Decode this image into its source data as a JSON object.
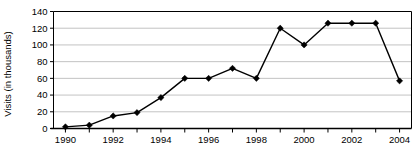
{
  "chart_data": {
    "type": "line",
    "title": "",
    "xlabel": "",
    "ylabel": "Visits (in thousands)",
    "x": [
      1990,
      1991,
      1992,
      1993,
      1994,
      1995,
      1996,
      1997,
      1998,
      1999,
      2000,
      2001,
      2002,
      2003,
      2004
    ],
    "values": [
      2,
      4,
      15,
      19,
      37,
      60,
      60,
      72,
      60,
      120,
      100,
      126,
      126,
      126,
      57
    ],
    "xlim": [
      1989.5,
      2004.5
    ],
    "ylim": [
      0,
      140
    ],
    "ytick_labels": [
      "0",
      "20",
      "40",
      "60",
      "80",
      "100",
      "120",
      "140"
    ],
    "ytick_values": [
      0,
      20,
      40,
      60,
      80,
      100,
      120,
      140
    ],
    "xtick_labels": [
      "1990",
      "1992",
      "1994",
      "1996",
      "1998",
      "2000",
      "2002",
      "2004"
    ],
    "xtick_values": [
      1990,
      1992,
      1994,
      1996,
      1998,
      2000,
      2002,
      2004
    ],
    "xminor_values": [
      1991,
      1993,
      1995,
      1997,
      1999,
      2001,
      2003
    ],
    "grid": "horizontal",
    "legend": "none",
    "marker": "diamond",
    "line_color": "#000000",
    "marker_color": "#000000",
    "grid_color": "#b3b3b3",
    "background": "#ffffff"
  }
}
